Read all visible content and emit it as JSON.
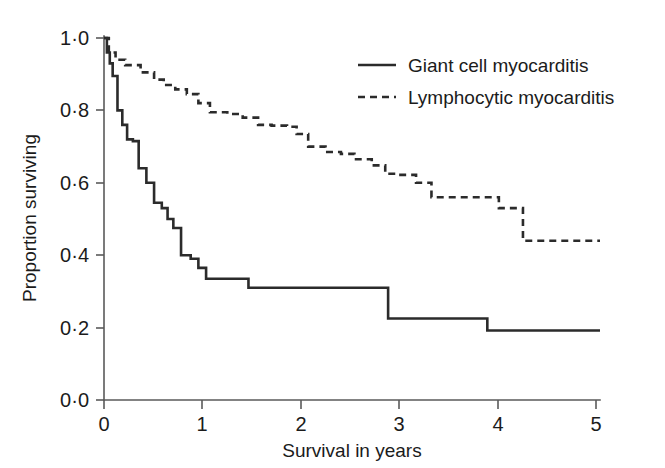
{
  "figure": {
    "background_color": "#ffffff",
    "line_color": "#2b2b2b",
    "axis_color": "#5a5a5a"
  },
  "axes": {
    "x_title": "Survival in years",
    "y_title": "Proportion surviving",
    "x_tick_labels": [
      "0",
      "1",
      "2",
      "3",
      "4",
      "5"
    ],
    "y_tick_labels": [
      "0·0",
      "0·2",
      "0·4",
      "0·6",
      "0·8",
      "1·0"
    ]
  },
  "legend": {
    "items": [
      {
        "label": "Giant cell myocarditis",
        "style": "solid"
      },
      {
        "label": "Lymphocytic myocarditis",
        "style": "dashed"
      }
    ]
  },
  "chart_data": {
    "type": "line",
    "subtype": "kaplan-meier-step",
    "title": "",
    "subtitle": "",
    "xlabel": "Survival in years",
    "ylabel": "Proportion surviving",
    "xlim": [
      0,
      5.15
    ],
    "ylim": [
      0.0,
      1.0
    ],
    "xticks": [
      0,
      1,
      2,
      3,
      4,
      5
    ],
    "yticks": [
      0.0,
      0.2,
      0.4,
      0.6,
      0.8,
      1.0
    ],
    "ytick_labels": [
      "0·0",
      "0·2",
      "0·4",
      "0·6",
      "0·8",
      "1·0"
    ],
    "grid": false,
    "legend_position": "top-right",
    "series": [
      {
        "name": "Giant cell myocarditis",
        "style": "solid",
        "step": "post",
        "x": [
          0.0,
          0.03,
          0.06,
          0.09,
          0.14,
          0.19,
          0.24,
          0.3,
          0.36,
          0.44,
          0.52,
          0.6,
          0.66,
          0.72,
          0.8,
          0.9,
          0.98,
          1.06,
          1.5,
          2.95,
          3.98,
          5.15
        ],
        "y": [
          1.0,
          0.96,
          0.93,
          0.895,
          0.8,
          0.76,
          0.72,
          0.715,
          0.64,
          0.6,
          0.545,
          0.53,
          0.5,
          0.475,
          0.4,
          0.39,
          0.365,
          0.335,
          0.31,
          0.225,
          0.192,
          0.192
        ]
      },
      {
        "name": "Lymphocytic myocarditis",
        "style": "dashed",
        "step": "post",
        "x": [
          0.0,
          0.05,
          0.12,
          0.22,
          0.38,
          0.52,
          0.62,
          0.74,
          0.86,
          0.98,
          1.1,
          1.28,
          1.44,
          1.6,
          1.74,
          1.9,
          2.0,
          2.12,
          2.3,
          2.46,
          2.6,
          2.78,
          2.92,
          3.06,
          3.24,
          3.4,
          3.95,
          4.1,
          4.35,
          5.15
        ],
        "y": [
          1.0,
          0.96,
          0.94,
          0.925,
          0.905,
          0.885,
          0.87,
          0.858,
          0.845,
          0.82,
          0.795,
          0.79,
          0.78,
          0.76,
          0.758,
          0.755,
          0.735,
          0.7,
          0.685,
          0.68,
          0.665,
          0.648,
          0.625,
          0.622,
          0.6,
          0.56,
          0.56,
          0.53,
          0.44,
          0.44
        ]
      }
    ]
  }
}
